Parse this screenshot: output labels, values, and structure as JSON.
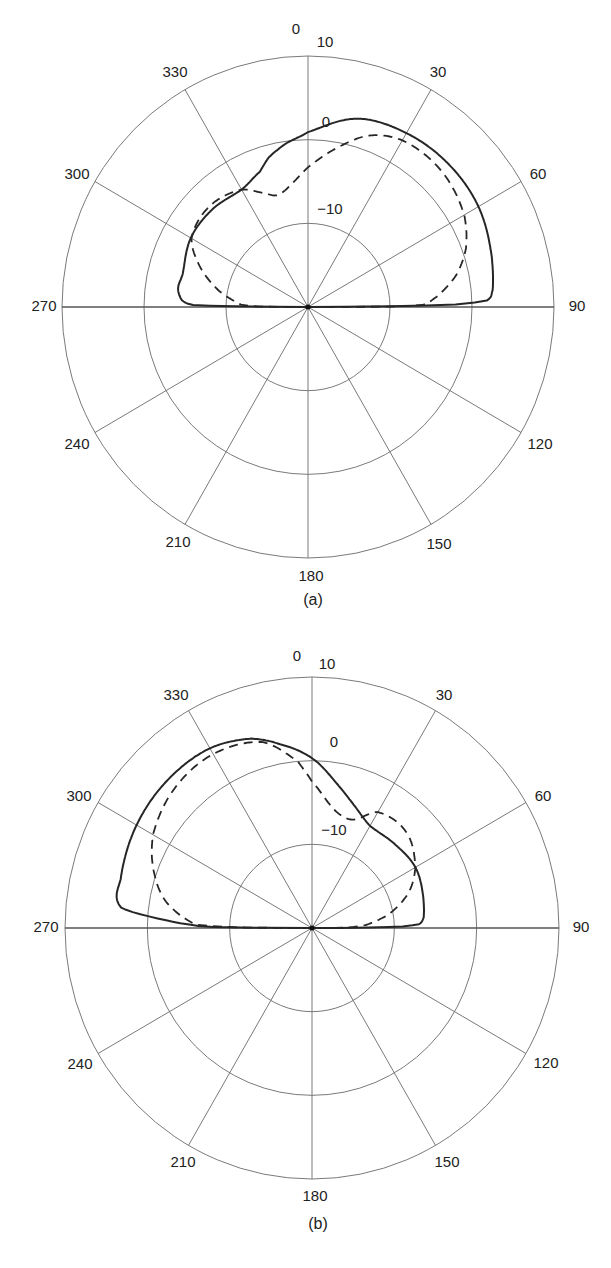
{
  "chart_data": [
    {
      "type": "polar-line",
      "caption": "(a)",
      "angle_labels": [
        "0",
        "30",
        "60",
        "90",
        "120",
        "150",
        "180",
        "210",
        "240",
        "270",
        "300",
        "330"
      ],
      "radial_labels": [
        "10",
        "0",
        "−10"
      ],
      "radial_range_db": [
        -20,
        10
      ],
      "radial_ticks_db": [
        -10,
        0,
        10
      ],
      "angle_direction": "clockwise, 0 at top",
      "series": [
        {
          "name": "solid",
          "style": "solid",
          "points": [
            [
              270,
              -20
            ],
            [
              270.5,
              -11
            ],
            [
              271,
              -6
            ],
            [
              273,
              -4.6
            ],
            [
              278,
              -4
            ],
            [
              285,
              -4.2
            ],
            [
              300,
              -3.5
            ],
            [
              315,
              -3.5
            ],
            [
              330,
              -3.8
            ],
            [
              340,
              -2.8
            ],
            [
              345,
              -1.5
            ],
            [
              352,
              -0.3
            ],
            [
              0,
              0.9
            ],
            [
              15,
              3.3
            ],
            [
              30,
              4
            ],
            [
              45,
              4.2
            ],
            [
              60,
              4
            ],
            [
              75,
              3.2
            ],
            [
              85,
              2.6
            ],
            [
              88,
              1.8
            ],
            [
              89,
              -2
            ],
            [
              89.5,
              -10
            ],
            [
              90,
              -20
            ]
          ]
        },
        {
          "name": "dashed",
          "style": "dashed",
          "points": [
            [
              270,
              -20
            ],
            [
              270.5,
              -14
            ],
            [
              272,
              -11.8
            ],
            [
              280,
              -9
            ],
            [
              290,
              -6
            ],
            [
              300,
              -3.6
            ],
            [
              315,
              -3
            ],
            [
              330,
              -3.8
            ],
            [
              340,
              -5.6
            ],
            [
              345,
              -6.1
            ],
            [
              352,
              -5.2
            ],
            [
              0,
              -3.3
            ],
            [
              10,
              -0.8
            ],
            [
              20,
              1.8
            ],
            [
              30,
              3
            ],
            [
              45,
              3
            ],
            [
              60,
              2
            ],
            [
              70,
              0.5
            ],
            [
              78,
              -1.5
            ],
            [
              85,
              -4
            ],
            [
              89,
              -6
            ],
            [
              89.7,
              -10
            ],
            [
              90,
              -20
            ]
          ]
        }
      ]
    },
    {
      "type": "polar-line",
      "caption": "(b)",
      "angle_labels": [
        "0",
        "30",
        "60",
        "90",
        "120",
        "150",
        "180",
        "210",
        "240",
        "270",
        "300",
        "330"
      ],
      "radial_labels": [
        "10",
        "0",
        "−10"
      ],
      "radial_range_db": [
        -20,
        10
      ],
      "radial_ticks_db": [
        -10,
        0,
        10
      ],
      "angle_direction": "clockwise, 0 at top",
      "series": [
        {
          "name": "solid",
          "style": "solid",
          "points": [
            [
              270,
              -20
            ],
            [
              270.5,
              -8
            ],
            [
              272,
              -4
            ],
            [
              276,
              3.3
            ],
            [
              285,
              4
            ],
            [
              300,
              4.6
            ],
            [
              315,
              4.9
            ],
            [
              330,
              4.8
            ],
            [
              342,
              3.8
            ],
            [
              350,
              2.3
            ],
            [
              0,
              0.3
            ],
            [
              10,
              -2.5
            ],
            [
              20,
              -4.6
            ],
            [
              30,
              -5.9
            ],
            [
              45,
              -5.8
            ],
            [
              60,
              -5.5
            ],
            [
              75,
              -6
            ],
            [
              85,
              -6.4
            ],
            [
              88,
              -7
            ],
            [
              89,
              -9
            ],
            [
              89.6,
              -13
            ],
            [
              90,
              -20
            ]
          ]
        },
        {
          "name": "dashed",
          "style": "dashed",
          "points": [
            [
              270,
              -20
            ],
            [
              270.3,
              -12
            ],
            [
              271.5,
              -6
            ],
            [
              280,
              -2
            ],
            [
              290,
              0.5
            ],
            [
              300,
              2.3
            ],
            [
              315,
              3.6
            ],
            [
              330,
              4
            ],
            [
              345,
              3
            ],
            [
              355,
              0
            ],
            [
              0,
              -2.5
            ],
            [
              8,
              -5
            ],
            [
              15,
              -6.1
            ],
            [
              22,
              -6
            ],
            [
              30,
              -4
            ],
            [
              45,
              -3.8
            ],
            [
              60,
              -5.5
            ],
            [
              70,
              -7.5
            ],
            [
              80,
              -10.5
            ],
            [
              87,
              -13.5
            ],
            [
              89.5,
              -16
            ],
            [
              90,
              -20
            ]
          ]
        }
      ]
    }
  ],
  "charts": [
    {
      "caption": "(a)",
      "labels": {
        "a0": "0",
        "a30": "30",
        "a60": "60",
        "a90": "90",
        "a120": "120",
        "a150": "150",
        "a180": "180",
        "a210": "210",
        "a240": "240",
        "a270": "270",
        "a300": "300",
        "a330": "330",
        "r10": "10",
        "r0": "0",
        "rm10": "−10"
      }
    },
    {
      "caption": "(b)",
      "labels": {
        "a0": "0",
        "a30": "30",
        "a60": "60",
        "a90": "90",
        "a120": "120",
        "a150": "150",
        "a180": "180",
        "a210": "210",
        "a240": "240",
        "a270": "270",
        "a300": "300",
        "a330": "330",
        "r10": "10",
        "r0": "0",
        "rm10": "−10"
      }
    }
  ],
  "colors": {
    "grid": "#7a7a7a",
    "curve": "#262626",
    "text": "#222222"
  }
}
